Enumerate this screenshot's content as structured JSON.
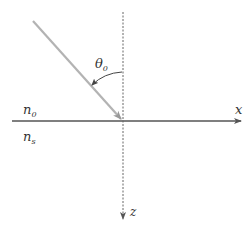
{
  "diagram": {
    "type": "ray-incidence-interface",
    "labels": {
      "angle": "θ",
      "angle_sub": "0",
      "medium_top": "n",
      "medium_top_sub": "0",
      "medium_bottom": "n",
      "medium_bottom_sub": "s",
      "x_axis": "x",
      "z_axis": "z"
    },
    "colors": {
      "axis": "#555555",
      "ray": "#b3b3b3",
      "arc": "#444444",
      "text": "#333333"
    }
  }
}
